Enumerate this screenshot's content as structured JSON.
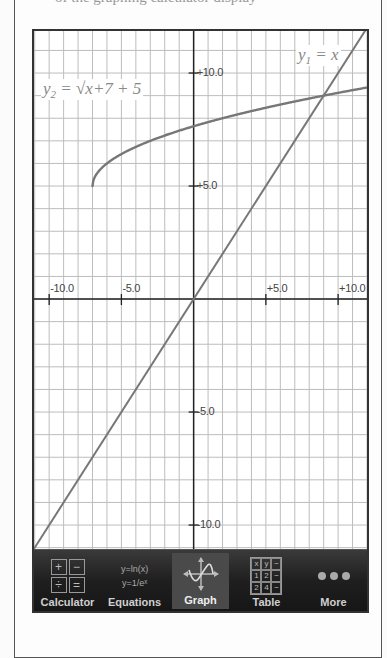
{
  "page": {
    "clipped_heading": "of the graphing calculator display"
  },
  "graph": {
    "x_range": [
      -11.05,
      12.0
    ],
    "y_range": [
      -11.06,
      11.86
    ],
    "grid_step": 1,
    "axis_color": "#222222",
    "grid_color": "#bdbdbd",
    "curve_color": "#777777",
    "x_tick_labels": [
      {
        "value": -10,
        "label": "-10.0"
      },
      {
        "value": -5,
        "label": "-5.0"
      },
      {
        "value": 5,
        "label": "+5.0"
      },
      {
        "value": 10,
        "label": "+10.0"
      }
    ],
    "y_tick_labels": [
      {
        "value": 10,
        "label": "+10.0"
      },
      {
        "value": 5,
        "label": "+5.0"
      },
      {
        "value": -5,
        "label": "-5.0"
      },
      {
        "value": -10,
        "label": "-10.0"
      }
    ],
    "equations": [
      {
        "id": "y1",
        "label_prefix": "y",
        "label_sub": "1",
        "label_expr": " = x",
        "formula": "x"
      },
      {
        "id": "y2",
        "label_prefix": "y",
        "label_sub": "2",
        "label_expr": " = √x+7 + 5",
        "formula": "sqrt(x+7)+5",
        "domain_start": -7
      }
    ],
    "intersection": {
      "x": 9,
      "y": 9
    }
  },
  "tab_bar": {
    "active": "Graph",
    "tabs": [
      {
        "id": "calculator",
        "label": "Calculator",
        "icon": "calculator-icon",
        "glyphs": [
          "+",
          "−",
          "÷",
          "="
        ]
      },
      {
        "id": "equations",
        "label": "Equations",
        "icon": "equations-icon",
        "glyphs": [
          "y=ln(x)",
          "y=1/eˣ"
        ]
      },
      {
        "id": "graph",
        "label": "Graph",
        "icon": "graph-icon"
      },
      {
        "id": "table",
        "label": "Table",
        "icon": "table-icon",
        "glyphs": [
          "x",
          "y",
          "−",
          "1",
          "2",
          "−",
          "2",
          "4",
          "−"
        ]
      },
      {
        "id": "more",
        "label": "More",
        "icon": "more-icon"
      }
    ]
  }
}
